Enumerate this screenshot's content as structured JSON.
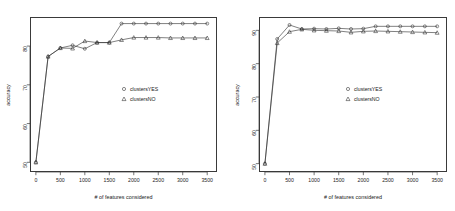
{
  "figure": {
    "panel_count": 2,
    "axis_title_x": "# of features considered",
    "axis_title_y": "accuracy",
    "legend": {
      "entries": [
        {
          "label": "clustersYES",
          "marker": "circle"
        },
        {
          "label": "clustersNO",
          "marker": "triangle"
        }
      ]
    }
  },
  "chart_data": [
    {
      "type": "line",
      "title": "",
      "panel": "left",
      "xlabel": "# of features considered",
      "ylabel": "accuracy",
      "xlim": [
        -120,
        3700
      ],
      "ylim": [
        47.5,
        87.5
      ],
      "xticks": [
        0,
        500,
        1000,
        1500,
        2000,
        2500,
        3000,
        3500
      ],
      "yticks": [
        50,
        60,
        70,
        80
      ],
      "grid": false,
      "legend_position": "center",
      "x": [
        0,
        250,
        500,
        750,
        1000,
        1250,
        1500,
        1750,
        2000,
        2250,
        2500,
        2750,
        3000,
        3250,
        3500
      ],
      "series": [
        {
          "name": "clustersYES",
          "marker": "circle",
          "values": [
            50.0,
            77.3,
            79.5,
            80.2,
            79.3,
            80.9,
            80.9,
            85.8,
            85.8,
            85.8,
            85.8,
            85.8,
            85.8,
            85.8,
            85.8
          ]
        },
        {
          "name": "clustersNO",
          "marker": "triangle",
          "values": [
            50.0,
            77.3,
            79.5,
            79.4,
            81.3,
            80.9,
            80.9,
            81.6,
            82.2,
            82.2,
            82.2,
            82.1,
            82.1,
            82.1,
            82.1
          ]
        }
      ]
    },
    {
      "type": "line",
      "title": "",
      "panel": "right",
      "xlabel": "# of features considered",
      "ylabel": "accuracy",
      "xlim": [
        -120,
        3700
      ],
      "ylim": [
        47.5,
        94.0
      ],
      "xticks": [
        0,
        500,
        1000,
        1500,
        2000,
        2500,
        3000,
        3500
      ],
      "yticks": [
        50,
        60,
        70,
        80,
        90
      ],
      "grid": false,
      "legend_position": "center",
      "x": [
        0,
        250,
        500,
        750,
        1000,
        1250,
        1500,
        1750,
        2000,
        2250,
        2500,
        2750,
        3000,
        3250,
        3500
      ],
      "series": [
        {
          "name": "clustersYES",
          "marker": "circle",
          "values": [
            50.0,
            87.4,
            91.6,
            90.4,
            90.5,
            90.4,
            90.6,
            90.4,
            90.5,
            91.2,
            91.2,
            91.2,
            91.2,
            91.2,
            91.2
          ]
        },
        {
          "name": "clustersNO",
          "marker": "triangle",
          "values": [
            50.0,
            86.2,
            89.6,
            90.3,
            90.0,
            89.9,
            89.8,
            89.4,
            89.7,
            89.8,
            89.7,
            89.6,
            89.5,
            89.4,
            89.3
          ]
        }
      ]
    }
  ]
}
